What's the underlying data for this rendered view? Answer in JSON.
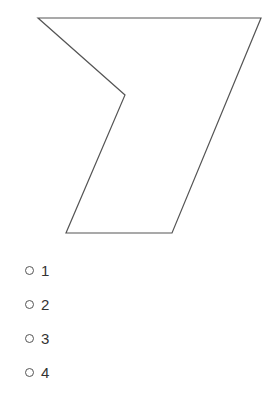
{
  "figure": {
    "shape": "polygon",
    "points": [
      [
        38,
        18
      ],
      [
        261,
        18
      ],
      [
        172,
        233
      ],
      [
        66,
        233
      ],
      [
        125,
        95
      ]
    ],
    "stroke": "#555555"
  },
  "options": [
    {
      "label": "1"
    },
    {
      "label": "2"
    },
    {
      "label": "3"
    },
    {
      "label": "4"
    }
  ]
}
